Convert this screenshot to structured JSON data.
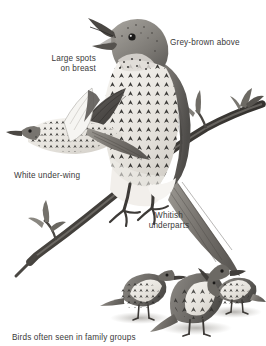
{
  "plate": {
    "subject": "thrush-field-guide-plate",
    "background_color": "#ffffff",
    "ink_color": "#3a3a3a",
    "medium": "greyscale-ink-illustration"
  },
  "labels": {
    "grey_brown_above": "Grey-brown above",
    "large_spots_on_breast": "Large spots\non breast",
    "white_under_wing": "White under-wing",
    "whitish_underparts": "Whitish\nunderparts",
    "family_groups": "Birds often seen in family groups"
  },
  "figures": {
    "perched_bird": "perched-thrush-singing",
    "flying_bird": "flying-thrush-underwing",
    "ground_birds": [
      "ground-thrush-left",
      "ground-thrush-centre",
      "ground-thrush-right"
    ],
    "branch": "bare-branch-with-buds"
  }
}
